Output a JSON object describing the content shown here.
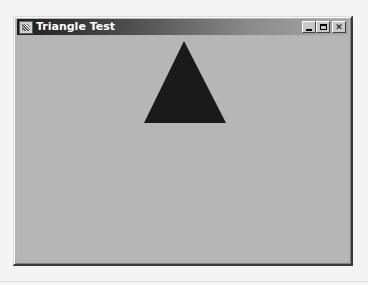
{
  "window": {
    "title": "Triangle Test",
    "icon": "java-cup-icon",
    "controls": {
      "minimize": "minimize-icon",
      "maximize": "maximize-icon",
      "close_label": "✕"
    }
  },
  "canvas": {
    "background": "#b6b6b6",
    "shape": {
      "type": "triangle",
      "fill": "#1a1a1a",
      "points": "167,4 127,86 209,86"
    }
  }
}
